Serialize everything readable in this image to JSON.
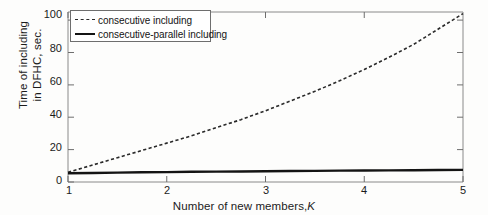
{
  "chart_data": {
    "type": "line",
    "title": "",
    "xlabel": "Number of new members, K",
    "xlabel_text": "Number of new members,",
    "xlabel_var": "K",
    "ylabel": "Time of including in DFHC, sec.",
    "ylabel_line1": "Time of including",
    "ylabel_line2": "in DFHC, sec.",
    "xlim": [
      1,
      5
    ],
    "ylim": [
      0,
      105
    ],
    "xticks": [
      1,
      2,
      3,
      4,
      5
    ],
    "xtick_labels": [
      "1",
      "2",
      "3",
      "4",
      "5"
    ],
    "yticks": [
      0,
      20,
      40,
      60,
      80,
      100
    ],
    "ytick_labels": [
      "0",
      "20",
      "40",
      "60",
      "80",
      "100"
    ],
    "grid": false,
    "legend_position": "top-left",
    "x": [
      1,
      1.25,
      1.5,
      1.75,
      2,
      2.25,
      2.5,
      2.75,
      3,
      3.25,
      3.5,
      3.75,
      4,
      4.25,
      4.5,
      4.75,
      5
    ],
    "series": [
      {
        "name": "consecutive including",
        "style": "dashed",
        "color": "#2a2a2a",
        "values": [
          6,
          10.5,
          15,
          19.5,
          24,
          28.5,
          33.5,
          38.5,
          44,
          50,
          56,
          62.5,
          69.5,
          77,
          85,
          94.5,
          104
        ]
      },
      {
        "name": "consecutive-parallel including",
        "style": "solid",
        "color": "#141414",
        "values": [
          5.4,
          5.6,
          5.8,
          6.0,
          6.1,
          6.3,
          6.4,
          6.5,
          6.6,
          6.8,
          6.9,
          7.0,
          7.1,
          7.2,
          7.3,
          7.4,
          7.5
        ]
      }
    ],
    "legend": [
      {
        "label": "consecutive including",
        "style": "dashed"
      },
      {
        "label": "consecutive-parallel including",
        "style": "solid"
      }
    ],
    "axis_color": "#8a8a8a",
    "text_color": "#1b1b1b"
  }
}
